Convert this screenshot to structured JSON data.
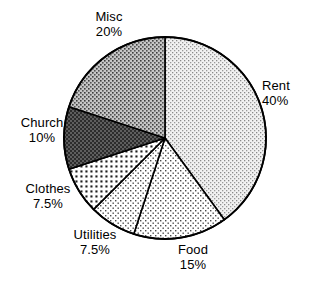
{
  "chart_data": {
    "type": "pie",
    "title": "",
    "subtitle": "",
    "xlabel": "",
    "ylabel": "",
    "legend_position": "none",
    "grid": false,
    "start_angle_deg": 0,
    "direction": "clockwise",
    "categories": [
      "Rent",
      "Food",
      "Utilities",
      "Clothes",
      "Church",
      "Misc"
    ],
    "values": [
      40,
      15,
      7.5,
      7.5,
      10,
      20
    ],
    "value_unit": "%",
    "slices": [
      {
        "label": "Rent",
        "value": 40,
        "value_text": "40%",
        "pattern": "light-dots",
        "fill": "#efefef",
        "dot_color": "#6d6d6d",
        "start_deg": 0,
        "end_deg": 144
      },
      {
        "label": "Food",
        "value": 15,
        "value_text": "15%",
        "pattern": "sparse-dots",
        "fill": "#ffffff",
        "dot_color": "#555555",
        "start_deg": 144,
        "end_deg": 198
      },
      {
        "label": "Utilities",
        "value": 7.5,
        "value_text": "7.5%",
        "pattern": "sparse-dots",
        "fill": "#ffffff",
        "dot_color": "#555555",
        "start_deg": 198,
        "end_deg": 225
      },
      {
        "label": "Clothes",
        "value": 7.5,
        "value_text": "7.5%",
        "pattern": "medium-dots-dark",
        "fill": "#ffffff",
        "dot_color": "#2a2a2a",
        "start_deg": 225,
        "end_deg": 252
      },
      {
        "label": "Church",
        "value": 10,
        "value_text": "10%",
        "pattern": "dark-checker",
        "fill": "#636363",
        "dot_color": "#1a1a1a",
        "start_deg": 252,
        "end_deg": 288
      },
      {
        "label": "Misc",
        "value": 20,
        "value_text": "20%",
        "pattern": "medium-dots",
        "fill": "#c8c8c8",
        "dot_color": "#4a4a4a",
        "start_deg": 288,
        "end_deg": 360
      }
    ],
    "geometry": {
      "center_x": 165,
      "center_y": 138,
      "radius": 101
    },
    "colors": {
      "outline": "#000000",
      "background": "#ffffff",
      "text": "#000000"
    }
  },
  "labels": {
    "rent": {
      "name": "Rent",
      "value": "40%"
    },
    "food": {
      "name": "Food",
      "value": "15%"
    },
    "utilities": {
      "name": "Utilities",
      "value": "7.5%"
    },
    "clothes": {
      "name": "Clothes",
      "value": "7.5%"
    },
    "church": {
      "name": "Church",
      "value": "10%"
    },
    "misc": {
      "name": "Misc",
      "value": "20%"
    }
  }
}
